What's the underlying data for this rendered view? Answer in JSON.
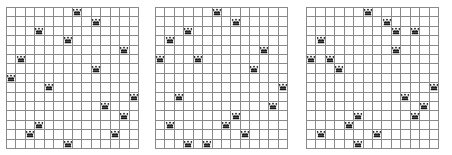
{
  "diagram": {
    "icon": "queen-icon",
    "grid_line_color": "#8a8a8a",
    "queen_color": "#1a1a1a",
    "background_color": "#ffffff",
    "boards": [
      {
        "name": "board-1",
        "label": "Board 1",
        "columns": 14,
        "rows": 15,
        "left": 6,
        "top": 7,
        "width": 133,
        "height": 142,
        "queen_count": 16,
        "queens": [
          {
            "col": 7,
            "row": 0
          },
          {
            "col": 9,
            "row": 1
          },
          {
            "col": 3,
            "row": 2
          },
          {
            "col": 6,
            "row": 3
          },
          {
            "col": 12,
            "row": 4
          },
          {
            "col": 1,
            "row": 5
          },
          {
            "col": 9,
            "row": 6
          },
          {
            "col": 0,
            "row": 7
          },
          {
            "col": 4,
            "row": 8
          },
          {
            "col": 13,
            "row": 9
          },
          {
            "col": 10,
            "row": 10
          },
          {
            "col": 12,
            "row": 11
          },
          {
            "col": 3,
            "row": 12
          },
          {
            "col": 2,
            "row": 13
          },
          {
            "col": 11,
            "row": 13
          },
          {
            "col": 6,
            "row": 14
          }
        ]
      },
      {
        "name": "board-2",
        "label": "Board 2",
        "columns": 14,
        "rows": 15,
        "left": 155,
        "top": 7,
        "width": 133,
        "height": 142,
        "queen_count": 17,
        "queens": [
          {
            "col": 6,
            "row": 0
          },
          {
            "col": 8,
            "row": 1
          },
          {
            "col": 3,
            "row": 2
          },
          {
            "col": 1,
            "row": 3
          },
          {
            "col": 11,
            "row": 4
          },
          {
            "col": 0,
            "row": 5
          },
          {
            "col": 4,
            "row": 5
          },
          {
            "col": 10,
            "row": 6
          },
          {
            "col": 13,
            "row": 8
          },
          {
            "col": 2,
            "row": 9
          },
          {
            "col": 12,
            "row": 10
          },
          {
            "col": 8,
            "row": 11
          },
          {
            "col": 7,
            "row": 12
          },
          {
            "col": 1,
            "row": 12
          },
          {
            "col": 9,
            "row": 13
          },
          {
            "col": 3,
            "row": 14
          },
          {
            "col": 5,
            "row": 14
          }
        ]
      },
      {
        "name": "board-3",
        "label": "Board 3",
        "columns": 14,
        "rows": 15,
        "left": 306,
        "top": 7,
        "width": 133,
        "height": 142,
        "queen_count": 17,
        "queens": [
          {
            "col": 6,
            "row": 0
          },
          {
            "col": 8,
            "row": 1
          },
          {
            "col": 9,
            "row": 2
          },
          {
            "col": 11,
            "row": 2
          },
          {
            "col": 1,
            "row": 3
          },
          {
            "col": 9,
            "row": 4
          },
          {
            "col": 0,
            "row": 5
          },
          {
            "col": 2,
            "row": 5
          },
          {
            "col": 3,
            "row": 6
          },
          {
            "col": 13,
            "row": 8
          },
          {
            "col": 10,
            "row": 9
          },
          {
            "col": 12,
            "row": 10
          },
          {
            "col": 5,
            "row": 11
          },
          {
            "col": 11,
            "row": 11
          },
          {
            "col": 4,
            "row": 12
          },
          {
            "col": 1,
            "row": 13
          },
          {
            "col": 7,
            "row": 13
          },
          {
            "col": 5,
            "row": 14
          }
        ]
      }
    ]
  }
}
